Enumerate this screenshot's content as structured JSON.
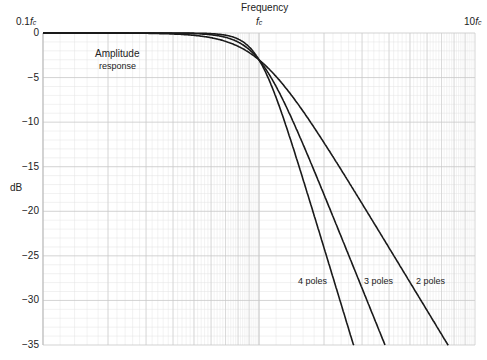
{
  "chart_data": {
    "type": "line",
    "title": "Frequency",
    "xlabel": "Frequency",
    "ylabel": "dB",
    "xscale": "log",
    "xlim_label": [
      "0.1f_c",
      "10f_c"
    ],
    "x_tick_labels": [
      {
        "label": "0.1",
        "sub": "c",
        "value": 0.1
      },
      {
        "label": "",
        "sub": "c",
        "value": 1.0
      },
      {
        "label": "10",
        "sub": "c",
        "value": 10.0
      }
    ],
    "ylim": [
      -35,
      0
    ],
    "y_ticks": [
      0,
      -5,
      -10,
      -15,
      -20,
      -25,
      -30,
      -35
    ],
    "y_tick_labels": [
      "0",
      "−5",
      "−10",
      "−15",
      "−20",
      "−25",
      "−30",
      "−35"
    ],
    "grid": true,
    "annotation": {
      "line1": "Amplitude",
      "line2": "response"
    },
    "x_units": "f / f_c",
    "series": [
      {
        "name": "2 poles",
        "order": 2,
        "x": [
          0.1,
          0.3,
          0.5,
          0.7,
          1.0,
          1.5,
          2.0,
          3.0,
          5.0,
          7.5
        ],
        "values": [
          0.0,
          -0.04,
          -0.26,
          -0.93,
          -3.01,
          -7.4,
          -12.3,
          -19.1,
          -28.0,
          -35.0
        ]
      },
      {
        "name": "3 poles",
        "order": 3,
        "x": [
          0.1,
          0.3,
          0.5,
          0.7,
          1.0,
          1.5,
          2.0,
          2.5,
          3.0,
          3.83
        ],
        "values": [
          0.0,
          0.0,
          -0.07,
          -0.49,
          -3.01,
          -10.9,
          -18.1,
          -23.9,
          -28.6,
          -35.0
        ]
      },
      {
        "name": "4 poles",
        "order": 4,
        "x": [
          0.1,
          0.3,
          0.5,
          0.7,
          1.0,
          1.5,
          2.0,
          2.5,
          2.74
        ],
        "values": [
          0.0,
          0.0,
          -0.02,
          -0.25,
          -3.01,
          -14.2,
          -24.1,
          -31.8,
          -35.0
        ]
      }
    ]
  },
  "labels": {
    "frequency": "Frequency",
    "x_left_num": "0.1",
    "x_mid_num": "",
    "x_right_num": "10",
    "f_letter": "f",
    "sub_c": "c",
    "ylabel": "dB",
    "annotation_line1": "Amplitude",
    "annotation_line2": "response",
    "pole4": "4 poles",
    "pole3": "3 poles",
    "pole2": "2 poles",
    "yticks": [
      "0",
      "−5",
      "−10",
      "−15",
      "−20",
      "−25",
      "−30",
      "−35"
    ]
  }
}
